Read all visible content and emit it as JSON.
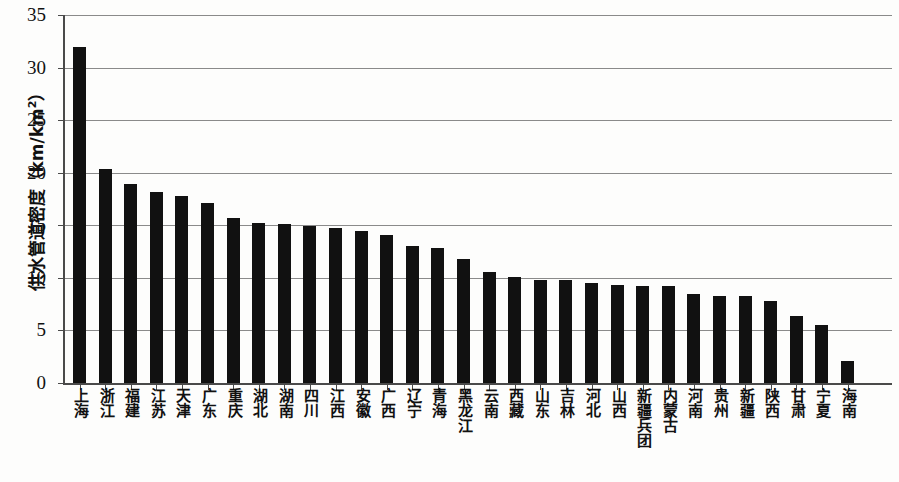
{
  "chart_data": {
    "type": "bar",
    "title": "",
    "xlabel": "",
    "ylabel": "供水管道密度（km/km²）",
    "ylabel_main": "供水管道密度（km/km",
    "ylabel_sup": "2",
    "ylabel_tail": "）",
    "ylim": [
      0,
      35
    ],
    "ytick_step": 5,
    "yticks": [
      "0",
      "5",
      "10",
      "15",
      "20",
      "25",
      "30",
      "35"
    ],
    "grid": true,
    "legend": "none",
    "bar_color": "#111111",
    "axis_color": "#4a4a4a",
    "grid_color": "#8a8a8a",
    "categories": [
      "上海",
      "浙江",
      "福建",
      "江苏",
      "天津",
      "广东",
      "重庆",
      "湖北",
      "湖南",
      "四川",
      "江西",
      "安徽",
      "广西",
      "辽宁",
      "青海",
      "黑龙江",
      "云南",
      "西藏",
      "山东",
      "吉林",
      "河北",
      "山西",
      "新疆兵团",
      "内蒙古",
      "河南",
      "贵州",
      "新疆",
      "陕西",
      "甘肃",
      "宁夏",
      "海南"
    ],
    "values": [
      32.0,
      20.4,
      18.9,
      18.2,
      17.8,
      17.1,
      15.7,
      15.2,
      15.1,
      14.9,
      14.7,
      14.5,
      14.1,
      13.0,
      12.8,
      11.8,
      10.6,
      10.1,
      9.8,
      9.8,
      9.5,
      9.3,
      9.2,
      9.2,
      8.5,
      8.3,
      8.3,
      7.8,
      6.4,
      5.5,
      2.1
    ]
  }
}
